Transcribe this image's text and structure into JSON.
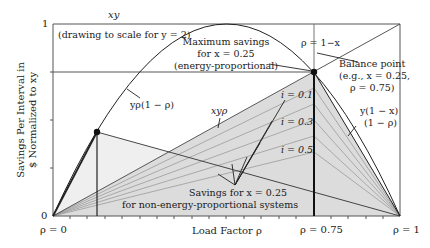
{
  "figure": {
    "y_axis_title_line1": "Savings Per Interval in",
    "y_axis_title_line2": "$ Normalized to xy",
    "x_axis_title": "Load Factor ρ",
    "y_tick_top": "1",
    "y_tick_bottom": "0",
    "x_tick_left": "ρ = 0",
    "x_tick_mid": "ρ = 0.75",
    "x_tick_right": "ρ = 1",
    "top_label": "xy",
    "scale_note": "(drawing to scale for y = 2)",
    "max_savings_line1": "Maximum savings",
    "max_savings_line2": "for x = 0.25",
    "max_savings_line3": "(energy-proportional)",
    "rho_eq_label": "ρ = 1−x",
    "balance_line1": "Balance point",
    "balance_line2": "(e.g., x = 0.25,",
    "balance_line3": "ρ = 0.75)",
    "curve_label": "yρ(1 − ρ)",
    "xyrho_label": "xyρ",
    "right_line_label1": "y(1 − x)",
    "right_line_label2": "(1 − ρ)",
    "i_labels": [
      "i = 0.1",
      "i = 0.3",
      "i = 0.5"
    ],
    "non_ep_line1": "Savings for x = 0.25",
    "non_ep_line2": "for non-energy-proportional systems"
  },
  "colors": {
    "line": "#222222",
    "grid_line": "#888888",
    "shade_dark": "#d9d9d9",
    "shade_light": "#ececec",
    "fan_line": "#9a9a9a"
  }
}
